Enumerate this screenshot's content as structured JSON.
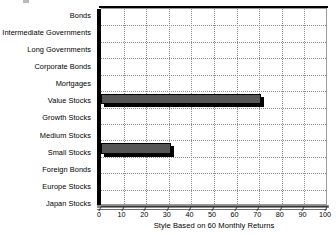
{
  "chart_data": {
    "type": "bar",
    "orientation": "horizontal",
    "title": "",
    "xlabel": "Style Based on 60 Monthly Returns",
    "ylabel": "",
    "xlim": [
      0,
      100
    ],
    "xticks": [
      0,
      10,
      20,
      30,
      40,
      50,
      60,
      70,
      80,
      90,
      100
    ],
    "grid": true,
    "legend": false,
    "bar_color": "#565656",
    "bar_edge_color": "#000000",
    "categories": [
      "Bonds",
      "Intermediate Governments",
      "Long Governments",
      "Corporate Bonds",
      "Mortgages",
      "Value Stocks",
      "Growth Stocks",
      "Medium Stocks",
      "Small Stocks",
      "Foreign Bonds",
      "Europe Stocks",
      "Japan Stocks"
    ],
    "values": [
      0,
      0,
      0,
      0,
      0,
      71,
      0,
      0,
      31,
      0,
      0,
      0
    ],
    "series": [
      {
        "name": "Style Based on 60 Monthly Returns",
        "values": [
          0,
          0,
          0,
          0,
          0,
          71,
          0,
          0,
          31,
          0,
          0,
          0
        ]
      }
    ]
  }
}
